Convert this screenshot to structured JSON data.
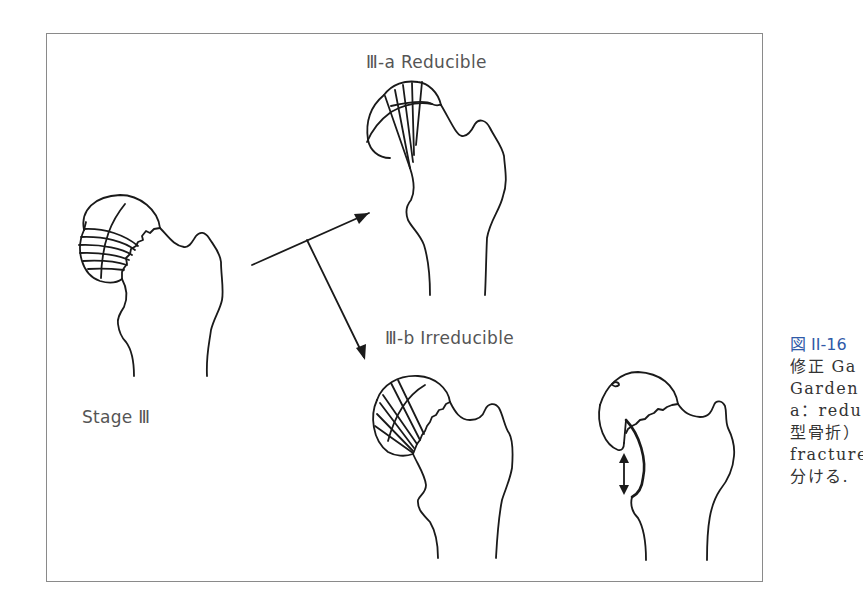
{
  "figure": {
    "labels": {
      "stage": "Stage Ⅲ",
      "reducible": "Ⅲ-a  Reducible",
      "irreducible": "Ⅲ-b  Irreducible"
    },
    "line_color": "#1a1a1a",
    "frame_color": "#8a8a8a"
  },
  "caption": {
    "title": "図 II-16",
    "title_color": "#2f5aa8",
    "lines": [
      "修正 Ga",
      "Garden",
      "a：redu",
      "型骨折）",
      "fracture",
      "分ける."
    ]
  }
}
